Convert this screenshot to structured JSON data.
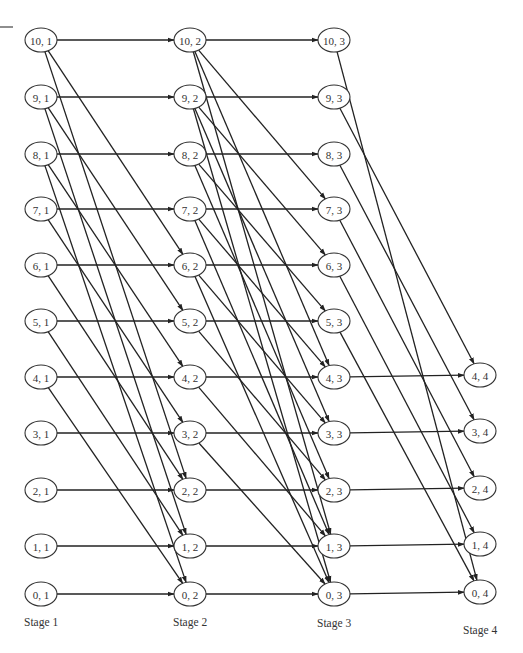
{
  "diagram": {
    "type": "staged-network",
    "colors": {
      "line": "#222222",
      "node_stroke": "#333333",
      "text": "#333333",
      "background": "#ffffff"
    },
    "stages": [
      {
        "id": 1,
        "label": "Stage 1",
        "x": 41,
        "label_y": 626
      },
      {
        "id": 2,
        "label": "Stage 2",
        "x": 190,
        "label_y": 626
      },
      {
        "id": 3,
        "label": "Stage 3",
        "x": 334,
        "label_y": 627
      },
      {
        "id": 4,
        "label": "Stage 4",
        "x": 480,
        "label_y": 634
      }
    ],
    "row_y": {
      "10": 40,
      "9": 97,
      "8": 154,
      "7": 209,
      "6": 265,
      "5": 321,
      "4": 377,
      "3": 433,
      "2": 490,
      "1": 546,
      "0": 594
    },
    "nodes": [
      {
        "s": 1,
        "k": 10,
        "label": "10, 1"
      },
      {
        "s": 1,
        "k": 9,
        "label": "9, 1"
      },
      {
        "s": 1,
        "k": 8,
        "label": "8, 1"
      },
      {
        "s": 1,
        "k": 7,
        "label": "7, 1"
      },
      {
        "s": 1,
        "k": 6,
        "label": "6, 1"
      },
      {
        "s": 1,
        "k": 5,
        "label": "5, 1"
      },
      {
        "s": 1,
        "k": 4,
        "label": "4, 1"
      },
      {
        "s": 1,
        "k": 3,
        "label": "3, 1"
      },
      {
        "s": 1,
        "k": 2,
        "label": "2, 1"
      },
      {
        "s": 1,
        "k": 1,
        "label": "1, 1"
      },
      {
        "s": 1,
        "k": 0,
        "label": "0, 1"
      },
      {
        "s": 2,
        "k": 10,
        "label": "10, 2"
      },
      {
        "s": 2,
        "k": 9,
        "label": "9, 2"
      },
      {
        "s": 2,
        "k": 8,
        "label": "8, 2"
      },
      {
        "s": 2,
        "k": 7,
        "label": "7, 2"
      },
      {
        "s": 2,
        "k": 6,
        "label": "6, 2"
      },
      {
        "s": 2,
        "k": 5,
        "label": "5, 2"
      },
      {
        "s": 2,
        "k": 4,
        "label": "4, 2"
      },
      {
        "s": 2,
        "k": 3,
        "label": "3, 2"
      },
      {
        "s": 2,
        "k": 2,
        "label": "2, 2"
      },
      {
        "s": 2,
        "k": 1,
        "label": "1, 2"
      },
      {
        "s": 2,
        "k": 0,
        "label": "0, 2"
      },
      {
        "s": 3,
        "k": 10,
        "label": "10, 3"
      },
      {
        "s": 3,
        "k": 9,
        "label": "9, 3"
      },
      {
        "s": 3,
        "k": 8,
        "label": "8, 3"
      },
      {
        "s": 3,
        "k": 7,
        "label": "7, 3"
      },
      {
        "s": 3,
        "k": 6,
        "label": "6, 3"
      },
      {
        "s": 3,
        "k": 5,
        "label": "5, 3"
      },
      {
        "s": 3,
        "k": 4,
        "label": "4, 3"
      },
      {
        "s": 3,
        "k": 3,
        "label": "3, 3"
      },
      {
        "s": 3,
        "k": 2,
        "label": "2, 3"
      },
      {
        "s": 3,
        "k": 1,
        "label": "1, 3"
      },
      {
        "s": 3,
        "k": 0,
        "label": "0, 3"
      },
      {
        "s": 4,
        "k": 4,
        "label": "4, 4"
      },
      {
        "s": 4,
        "k": 3,
        "label": "3, 4"
      },
      {
        "s": 4,
        "k": 2,
        "label": "2, 4"
      },
      {
        "s": 4,
        "k": 1,
        "label": "1, 4"
      },
      {
        "s": 4,
        "k": 0,
        "label": "0, 4"
      }
    ],
    "edges": [
      [
        1,
        10,
        2,
        10
      ],
      [
        1,
        10,
        2,
        6
      ],
      [
        1,
        10,
        2,
        2
      ],
      [
        1,
        9,
        2,
        9
      ],
      [
        1,
        9,
        2,
        5
      ],
      [
        1,
        9,
        2,
        1
      ],
      [
        1,
        8,
        2,
        8
      ],
      [
        1,
        8,
        2,
        4
      ],
      [
        1,
        8,
        2,
        0
      ],
      [
        1,
        7,
        2,
        7
      ],
      [
        1,
        7,
        2,
        3
      ],
      [
        1,
        6,
        2,
        6
      ],
      [
        1,
        6,
        2,
        2
      ],
      [
        1,
        5,
        2,
        5
      ],
      [
        1,
        5,
        2,
        1
      ],
      [
        1,
        4,
        2,
        4
      ],
      [
        1,
        4,
        2,
        0
      ],
      [
        1,
        3,
        2,
        3
      ],
      [
        1,
        2,
        2,
        2
      ],
      [
        1,
        1,
        2,
        1
      ],
      [
        1,
        0,
        2,
        0
      ],
      [
        2,
        10,
        3,
        10
      ],
      [
        2,
        10,
        3,
        7
      ],
      [
        2,
        10,
        3,
        4
      ],
      [
        2,
        10,
        3,
        1
      ],
      [
        2,
        9,
        3,
        9
      ],
      [
        2,
        9,
        3,
        6
      ],
      [
        2,
        9,
        3,
        3
      ],
      [
        2,
        9,
        3,
        0
      ],
      [
        2,
        8,
        3,
        8
      ],
      [
        2,
        8,
        3,
        5
      ],
      [
        2,
        8,
        3,
        2
      ],
      [
        2,
        7,
        3,
        7
      ],
      [
        2,
        7,
        3,
        4
      ],
      [
        2,
        7,
        3,
        1
      ],
      [
        2,
        6,
        3,
        6
      ],
      [
        2,
        6,
        3,
        3
      ],
      [
        2,
        6,
        3,
        0
      ],
      [
        2,
        5,
        3,
        5
      ],
      [
        2,
        5,
        3,
        2
      ],
      [
        2,
        4,
        3,
        4
      ],
      [
        2,
        4,
        3,
        1
      ],
      [
        2,
        3,
        3,
        3
      ],
      [
        2,
        3,
        3,
        0
      ],
      [
        2,
        2,
        3,
        2
      ],
      [
        2,
        1,
        3,
        1
      ],
      [
        2,
        0,
        3,
        0
      ],
      [
        3,
        10,
        4,
        0
      ],
      [
        3,
        9,
        4,
        4
      ],
      [
        3,
        8,
        4,
        3
      ],
      [
        3,
        7,
        4,
        2
      ],
      [
        3,
        6,
        4,
        1
      ],
      [
        3,
        5,
        4,
        0
      ],
      [
        3,
        4,
        4,
        4
      ],
      [
        3,
        3,
        4,
        3
      ],
      [
        3,
        2,
        4,
        2
      ],
      [
        3,
        1,
        4,
        1
      ],
      [
        3,
        0,
        4,
        0
      ]
    ],
    "node_rx": 16,
    "node_ry": 12
  }
}
